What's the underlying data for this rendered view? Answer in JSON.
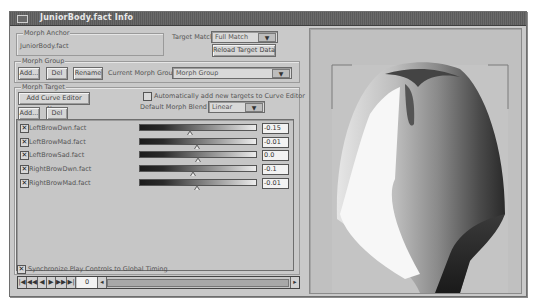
{
  "window": {
    "title": "JuniorBody.fact Info"
  },
  "morph_anchor": {
    "group_label": "Morph Anchor",
    "value": "JuniorBody.fact"
  },
  "target_match": {
    "label": "Target Match:",
    "selected": "Full Match",
    "reload_label": "Reload Target Data"
  },
  "morph_group": {
    "group_label": "Morph Group",
    "add_label": "Add...",
    "del_label": "Del",
    "rename_label": "Rename",
    "current_label": "Current Morph Group:",
    "current_value": "Morph Group"
  },
  "morph_target": {
    "group_label": "Morph Target",
    "add_curve_editor_label": "Add Curve Editor Now",
    "auto_add_label": "Automatically add new targets to Curve Editor",
    "auto_add_checked": false,
    "default_blend_label": "Default Morph Blend To",
    "default_blend_value": "Linear",
    "add_label": "Add...",
    "del_label": "Del"
  },
  "targets": [
    {
      "name": "LeftBrowDwn.fact",
      "checked": true,
      "value": "-0.15",
      "thumb_pct": 40
    },
    {
      "name": "LeftBrowMad.fact",
      "checked": true,
      "value": "-0.01",
      "thumb_pct": 47
    },
    {
      "name": "LeftBrowSad.fact",
      "checked": true,
      "value": "0.0",
      "thumb_pct": 48
    },
    {
      "name": "RightBrowDwn.fact",
      "checked": true,
      "value": "-0.1",
      "thumb_pct": 43
    },
    {
      "name": "RightBrowMad.fact",
      "checked": true,
      "value": "-0.01",
      "thumb_pct": 47
    }
  ],
  "sync": {
    "label": "Synchronize Play Controls to Global Timing",
    "checked": true
  },
  "playback": {
    "buttons": [
      "go-to-start",
      "step-back",
      "play-reverse",
      "play",
      "step-forward",
      "go-to-end"
    ],
    "glyphs": [
      "|◀",
      "◀◀",
      "◀",
      "▶",
      "▶▶",
      "▶|"
    ],
    "frame": "0",
    "scroll_left": "◂",
    "scroll_right": "▸"
  },
  "colors": {
    "window_bg": "#c9c9c9",
    "titlebar": "#5f5f5f",
    "viewport_bg": "#c0c0c0"
  }
}
